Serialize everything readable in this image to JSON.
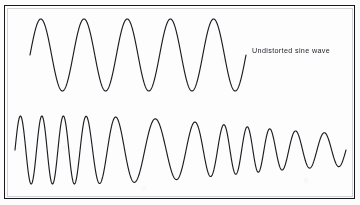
{
  "figure": {
    "background_color": "#fdfdfd",
    "frame_color": "#15181c",
    "stroke_color": "#1a1d21",
    "caption": "Undistorted sine wave"
  },
  "chart_data": {
    "type": "line",
    "title": "",
    "xlabel": "",
    "ylabel": "",
    "grid": false,
    "legend": "none",
    "annotations": [
      {
        "text": "Undistorted sine wave",
        "x": 252,
        "y": 52,
        "target_series": "undistorted-sine-wave"
      }
    ],
    "series": [
      {
        "name": "undistorted-sine-wave",
        "description": "Clean sine wave with constant amplitude and constant frequency",
        "cycles": 5,
        "amplitude": 1.0,
        "amplitude_profile": [
          1.0,
          1.0,
          1.0,
          1.0,
          1.0,
          1.0
        ],
        "frequency_profile": [
          1.0,
          1.0,
          1.0,
          1.0,
          1.0,
          1.0
        ],
        "x_start": 30,
        "x_end": 246,
        "baseline_y": 55,
        "pixel_amplitude": 36,
        "peak_x": [
          52,
          95,
          138,
          181,
          224
        ],
        "trough_x": [
          73,
          116,
          159,
          202,
          240
        ]
      },
      {
        "name": "distorted-sine-wave",
        "description": "Distorted sine wave: frequency varies across the sweep and amplitude decays toward the right",
        "cycles": 12,
        "amplitude": 1.0,
        "amplitude_profile": [
          1.0,
          1.0,
          1.0,
          0.98,
          0.95,
          0.9,
          0.82,
          0.74,
          0.66,
          0.58,
          0.52,
          0.48
        ],
        "frequency_profile": [
          1.9,
          1.95,
          1.85,
          1.3,
          1.0,
          0.95,
          1.2,
          1.7,
          1.9,
          1.55,
          1.4,
          1.45
        ],
        "x_start": 15,
        "x_end": 346,
        "baseline_y": 150,
        "pixel_amplitude": 34,
        "peak_x": [
          23,
          40,
          56,
          72,
          98,
          128,
          158,
          182,
          203,
          222,
          248,
          275,
          305
        ],
        "trough_x": [
          31,
          48,
          64,
          84,
          112,
          143,
          170,
          192,
          213,
          235,
          262,
          290,
          320
        ]
      }
    ]
  }
}
